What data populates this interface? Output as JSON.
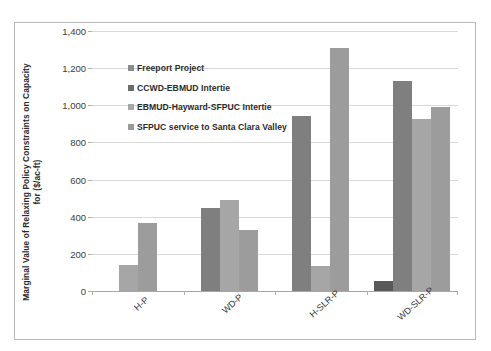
{
  "chart_data": {
    "type": "bar",
    "title": "",
    "xlabel": "",
    "ylabel": "Marginal Value of Relaxing Policy Constraints on Capacity for ($/ac-ft)",
    "ylabel_line1": "Marginal Value of Relaxing Policy Constraints on Capacity",
    "ylabel_line2": "for ($/ac-ft)",
    "categories": [
      "H-P",
      "WD-P",
      "H-SLR-P",
      "WD-SLR-P"
    ],
    "ylim": [
      0,
      1400
    ],
    "ytick_values": [
      0,
      200,
      400,
      600,
      800,
      1000,
      1200,
      1400
    ],
    "ytick_labels": [
      "0",
      "200",
      "400",
      "600",
      "800",
      "1,000",
      "1,200",
      "1,400"
    ],
    "grid": true,
    "legend_position": "inside-upper-left",
    "series": [
      {
        "name": "Freeport Project",
        "color": "#595959",
        "values": [
          0,
          0,
          0,
          55
        ]
      },
      {
        "name": "CCWD-EBMUD Intertie",
        "color": "#7f7f7f",
        "values": [
          0,
          445,
          940,
          1130
        ]
      },
      {
        "name": "EBMUD-Hayward-SFPUC Intertie",
        "color": "#a6a6a6",
        "values": [
          140,
          490,
          135,
          925
        ]
      },
      {
        "name": "SFPUC service to Santa Clara Valley",
        "color": "#9c9c9c",
        "values": [
          365,
          330,
          1310,
          990
        ]
      }
    ]
  },
  "legend": {
    "items": [
      {
        "label": "Freeport Project",
        "color": "#8c8c8c"
      },
      {
        "label": "CCWD-EBMUD Intertie",
        "color": "#6b6b6b"
      },
      {
        "label": "EBMUD-Hayward-SFPUC Intertie",
        "color": "#a8a8a8"
      },
      {
        "label": "SFPUC service to Santa Clara Valley",
        "color": "#9a9a9a"
      }
    ]
  }
}
